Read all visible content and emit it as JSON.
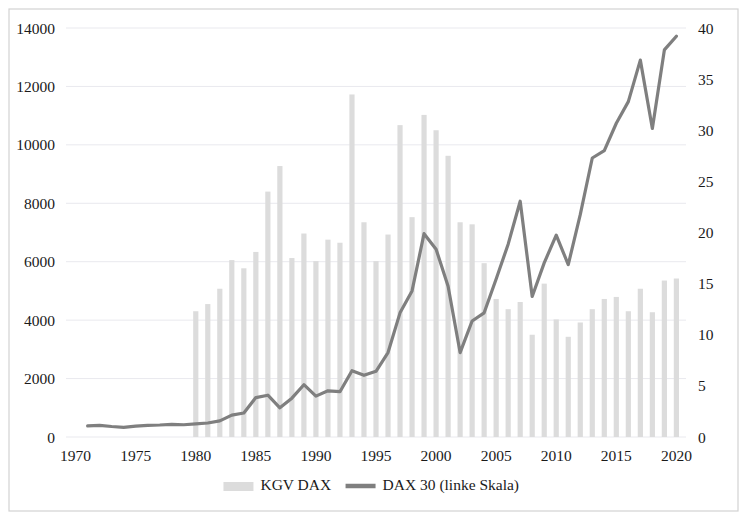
{
  "figure": {
    "name": "dax-kgv-chart",
    "background": "#ffffff",
    "border_color": "#d2d2d2",
    "grid_color": "#e9e9ee",
    "width": 747,
    "height": 520
  },
  "legend": {
    "position": "bottom-center",
    "entries": [
      {
        "label": "KGV DAX",
        "type": "bar",
        "color": "#dcdcdc"
      },
      {
        "label": "DAX 30 (linke Skala)",
        "type": "line",
        "color": "#7f7f7f"
      }
    ]
  },
  "chart_data": {
    "type": "bar",
    "title": "",
    "subtitle": "",
    "xlabel": "",
    "ylabel": "",
    "grid": true,
    "legend_position": "bottom",
    "x": [
      1970,
      1971,
      1972,
      1973,
      1974,
      1975,
      1976,
      1977,
      1978,
      1979,
      1980,
      1981,
      1982,
      1983,
      1984,
      1985,
      1986,
      1987,
      1988,
      1989,
      1990,
      1991,
      1992,
      1993,
      1994,
      1995,
      1996,
      1997,
      1998,
      1999,
      2000,
      2001,
      2002,
      2003,
      2004,
      2005,
      2006,
      2007,
      2008,
      2009,
      2010,
      2011,
      2012,
      2013,
      2014,
      2015,
      2016,
      2017,
      2018,
      2019,
      2020
    ],
    "x_ticks": [
      1970,
      1975,
      1980,
      1985,
      1990,
      1995,
      2000,
      2005,
      2010,
      2015,
      2020
    ],
    "xlim": [
      1969.2,
      2020.8
    ],
    "axes": {
      "left": {
        "name": "DAX 30 (linke Skala)",
        "ylim": [
          0,
          14000
        ],
        "ticks": [
          0,
          2000,
          4000,
          6000,
          8000,
          10000,
          12000,
          14000
        ],
        "tick_labels": [
          "0",
          "2000",
          "4000",
          "6000",
          "8000",
          "10000",
          "12000",
          "14000"
        ]
      },
      "right": {
        "name": "KGV DAX",
        "ylim": [
          0,
          40
        ],
        "ticks": [
          0,
          5,
          10,
          15,
          20,
          25,
          30,
          35,
          40
        ],
        "tick_labels": [
          "0",
          "5",
          "10",
          "15",
          "20",
          "25",
          "30",
          "35",
          "40"
        ]
      }
    },
    "series": [
      {
        "name": "KGV DAX",
        "type": "bar",
        "axis": "right",
        "color": "#dcdcdc",
        "values": [
          null,
          null,
          null,
          null,
          null,
          null,
          null,
          null,
          null,
          null,
          12.3,
          13.0,
          14.5,
          17.3,
          16.5,
          18.1,
          24.0,
          26.5,
          17.5,
          19.9,
          17.2,
          19.3,
          19.0,
          33.5,
          21.0,
          17.2,
          19.8,
          30.5,
          21.5,
          31.5,
          30.0,
          27.5,
          21.0,
          20.8,
          17.0,
          13.5,
          12.5,
          13.2,
          10.0,
          15.0,
          11.5,
          9.8,
          11.2,
          12.5,
          13.5,
          13.7,
          12.3,
          14.5,
          12.2,
          15.3,
          15.5
        ]
      },
      {
        "name": "DAX 30 (linke Skala)",
        "type": "line",
        "axis": "left",
        "color": "#7f7f7f",
        "line_width": 3.2,
        "values": [
          null,
          380,
          400,
          360,
          330,
          370,
          400,
          410,
          430,
          420,
          450,
          480,
          550,
          750,
          820,
          1350,
          1430,
          1000,
          1330,
          1790,
          1400,
          1580,
          1550,
          2270,
          2110,
          2250,
          2890,
          4250,
          5000,
          6960,
          6430,
          5160,
          2890,
          3970,
          4250,
          5410,
          6600,
          8070,
          4810,
          5960,
          6910,
          5900,
          7610,
          9550,
          9800,
          10740,
          11480,
          12900,
          10560,
          13250,
          13720
        ]
      }
    ]
  }
}
